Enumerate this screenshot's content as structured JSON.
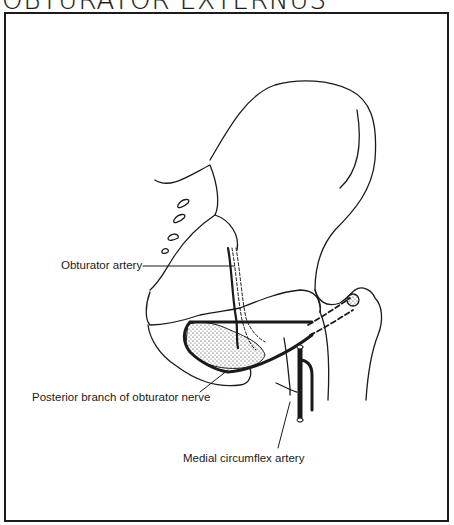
{
  "title": "Obturator Externus",
  "title_display": "OBTURATOR EXTERNUS",
  "labels": {
    "obturator_artery": "Obturator artery",
    "posterior_branch": "Posterior branch of obturator nerve",
    "medial_circumflex": "Medial circumflex artery"
  },
  "colors": {
    "ink": "#1a1a1a",
    "paper": "#ffffff"
  }
}
